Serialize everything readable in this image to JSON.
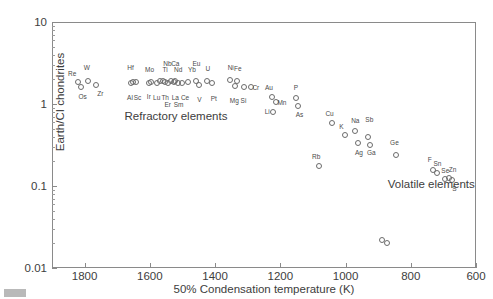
{
  "chart_data": {
    "type": "scatter",
    "title": "",
    "xlabel": "50% Condensation temperature (K)",
    "ylabel": "Earth/CI chondrites",
    "xlim": [
      1900,
      600
    ],
    "ylim": [
      0.01,
      10
    ],
    "yscale": "log",
    "xscale": "linear",
    "x_inverted": true,
    "grid": false,
    "legend": "none",
    "xticks": [
      1800,
      1600,
      1400,
      1200,
      1000,
      800,
      600
    ],
    "xtick_labels": [
      "1800",
      "1600",
      "1400",
      "1200",
      "1000",
      "800",
      "600"
    ],
    "yticks": [
      10,
      1,
      0.1,
      0.01
    ],
    "ytick_labels": [
      "10",
      "1",
      "0.1",
      "0.01"
    ],
    "annotations": [
      {
        "text": "Refractory elements",
        "x": 1520,
        "y": 0.72
      },
      {
        "text": "Volatile elements",
        "x": 737,
        "y": 0.105
      }
    ],
    "points": [
      {
        "label": "Re",
        "x": 1821,
        "y": 1.85,
        "lx": 1838,
        "ly": 2.35
      },
      {
        "label": "W",
        "x": 1789,
        "y": 1.9,
        "lx": 1793,
        "ly": 2.75
      },
      {
        "label": "Os",
        "x": 1812,
        "y": 1.62,
        "lx": 1806,
        "ly": 1.22
      },
      {
        "label": "Zr",
        "x": 1764,
        "y": 1.72,
        "lx": 1752,
        "ly": 1.32
      },
      {
        "label": "Hf",
        "x": 1652,
        "y": 1.88,
        "lx": 1659,
        "ly": 2.72
      },
      {
        "label": "Al",
        "x": 1657,
        "y": 1.82,
        "lx": 1661,
        "ly": 1.18
      },
      {
        "label": "Sc",
        "x": 1641,
        "y": 1.84,
        "lx": 1638,
        "ly": 1.18
      },
      {
        "label": "Mo",
        "x": 1596,
        "y": 1.88,
        "lx": 1601,
        "ly": 2.62
      },
      {
        "label": "Ir",
        "x": 1603,
        "y": 1.8,
        "lx": 1603,
        "ly": 1.22
      },
      {
        "label": "Ti",
        "x": 1570,
        "y": 1.9,
        "lx": 1553,
        "ly": 2.62
      },
      {
        "label": "Lu",
        "x": 1578,
        "y": 1.82,
        "lx": 1579,
        "ly": 1.2
      },
      {
        "label": "Nb",
        "x": 1559,
        "y": 1.92,
        "lx": 1546,
        "ly": 3.05
      },
      {
        "label": "Th",
        "x": 1553,
        "y": 1.83,
        "lx": 1553,
        "ly": 1.2
      },
      {
        "label": "Er",
        "x": 1545,
        "y": 1.8,
        "lx": 1545,
        "ly": 0.96
      },
      {
        "label": "Ca",
        "x": 1535,
        "y": 1.92,
        "lx": 1522,
        "ly": 3.05
      },
      {
        "label": "Nd",
        "x": 1524,
        "y": 1.9,
        "lx": 1513,
        "ly": 2.62
      },
      {
        "label": "La",
        "x": 1527,
        "y": 1.84,
        "lx": 1522,
        "ly": 1.2
      },
      {
        "label": "Sm",
        "x": 1515,
        "y": 1.8,
        "lx": 1512,
        "ly": 0.96
      },
      {
        "label": "Ce",
        "x": 1500,
        "y": 1.82,
        "lx": 1492,
        "ly": 1.2
      },
      {
        "label": "Yb",
        "x": 1483,
        "y": 1.88,
        "lx": 1471,
        "ly": 2.62
      },
      {
        "label": "Eu",
        "x": 1458,
        "y": 1.92,
        "lx": 1457,
        "ly": 3.1
      },
      {
        "label": "V",
        "x": 1450,
        "y": 1.72,
        "lx": 1448,
        "ly": 1.12
      },
      {
        "label": "U",
        "x": 1425,
        "y": 1.9,
        "lx": 1422,
        "ly": 2.7
      },
      {
        "label": "Pt",
        "x": 1408,
        "y": 1.78,
        "lx": 1404,
        "ly": 1.15
      },
      {
        "label": "Ni",
        "x": 1353,
        "y": 1.95,
        "lx": 1352,
        "ly": 2.78
      },
      {
        "label": "Fe",
        "x": 1334,
        "y": 1.92,
        "lx": 1330,
        "ly": 2.7
      },
      {
        "label": "Mg",
        "x": 1340,
        "y": 1.68,
        "lx": 1341,
        "ly": 1.08
      },
      {
        "label": "Si",
        "x": 1312,
        "y": 1.62,
        "lx": 1313,
        "ly": 1.08
      },
      {
        "label": "Cr",
        "x": 1291,
        "y": 1.6,
        "lx": 1275,
        "ly": 1.58
      },
      {
        "label": "Au",
        "x": 1226,
        "y": 1.22,
        "lx": 1235,
        "ly": 1.58
      },
      {
        "label": "Mn",
        "x": 1212,
        "y": 1.05,
        "lx": 1195,
        "ly": 1.04
      },
      {
        "label": "P",
        "x": 1151,
        "y": 1.18,
        "lx": 1152,
        "ly": 1.58
      },
      {
        "label": "As",
        "x": 1145,
        "y": 0.94,
        "lx": 1141,
        "ly": 0.73
      },
      {
        "label": "Li",
        "x": 1223,
        "y": 0.8,
        "lx": 1240,
        "ly": 0.79
      },
      {
        "label": "Cu",
        "x": 1042,
        "y": 0.58,
        "lx": 1049,
        "ly": 0.76
      },
      {
        "label": "K",
        "x": 1001,
        "y": 0.42,
        "lx": 1013,
        "ly": 0.53
      },
      {
        "label": "Na",
        "x": 972,
        "y": 0.47,
        "lx": 970,
        "ly": 0.62
      },
      {
        "label": "Ag",
        "x": 963,
        "y": 0.33,
        "lx": 959,
        "ly": 0.25
      },
      {
        "label": "Sb",
        "x": 930,
        "y": 0.4,
        "lx": 927,
        "ly": 0.63
      },
      {
        "label": "Ga",
        "x": 924,
        "y": 0.32,
        "lx": 921,
        "ly": 0.25
      },
      {
        "label": "Ge",
        "x": 845,
        "y": 0.24,
        "lx": 850,
        "ly": 0.33
      },
      {
        "label": "Rb",
        "x": 1081,
        "y": 0.175,
        "lx": 1090,
        "ly": 0.225
      },
      {
        "label": "F",
        "x": 733,
        "y": 0.155,
        "lx": 742,
        "ly": 0.205
      },
      {
        "label": "Sn",
        "x": 720,
        "y": 0.145,
        "lx": 718,
        "ly": 0.185
      },
      {
        "label": "Se",
        "x": 696,
        "y": 0.122,
        "lx": 694,
        "ly": 0.153
      },
      {
        "label": "Zn",
        "x": 683,
        "y": 0.125,
        "lx": 672,
        "ly": 0.155
      },
      {
        "label": "S",
        "x": 675,
        "y": 0.118,
        "lx": 666,
        "ly": 0.093
      },
      {
        "label": "",
        "x": 872,
        "y": 0.02,
        "lx": null,
        "ly": null
      },
      {
        "label": "",
        "x": 889,
        "y": 0.022,
        "lx": null,
        "ly": null
      }
    ]
  }
}
